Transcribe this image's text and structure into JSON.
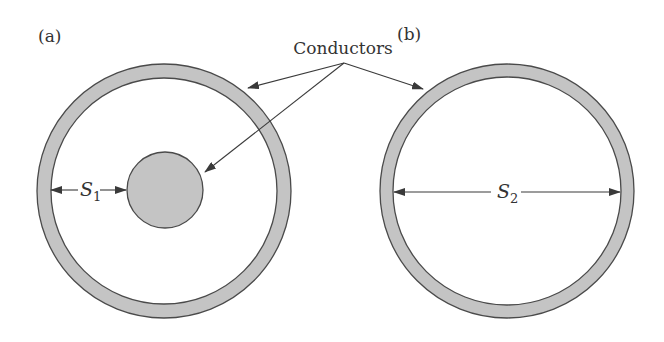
{
  "figure": {
    "panels": [
      {
        "id": "a",
        "label": "(a)",
        "description": "Coaxial configuration: outer conducting ring with inner solid conductor",
        "dimension": {
          "symbol": "S",
          "subscript": "1"
        }
      },
      {
        "id": "b",
        "label": "(b)",
        "description": "Single hollow conducting ring",
        "dimension": {
          "symbol": "S",
          "subscript": "2"
        }
      }
    ],
    "callout": {
      "label": "Conductors",
      "targets": [
        "outer ring (a)",
        "inner conductor (a)",
        "ring (b)"
      ]
    },
    "colors": {
      "conductor_fill": "#c4c4c4",
      "outline": "#4a4a4a",
      "text": "#333333",
      "background": "#ffffff"
    }
  }
}
